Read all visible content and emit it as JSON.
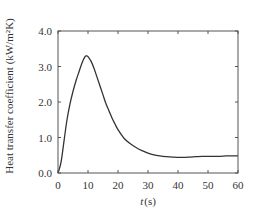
{
  "chart_data": {
    "type": "line",
    "title": "",
    "xlabel": "t (s)",
    "xlabel_var": "t",
    "xlabel_unit": "(s)",
    "ylabel": "Heat transfer coefficient (kW/m²K)",
    "xlim": [
      0,
      60
    ],
    "ylim": [
      0.0,
      4.0
    ],
    "xticks": [
      0,
      10,
      20,
      30,
      40,
      50,
      60
    ],
    "xtick_labels": [
      "0",
      "10",
      "20",
      "30",
      "40",
      "50",
      "60"
    ],
    "yticks": [
      0.0,
      1.0,
      2.0,
      3.0,
      4.0
    ],
    "ytick_labels": [
      "0.0",
      "1.0",
      "2.0",
      "3.0",
      "4.0"
    ],
    "grid": false,
    "legend": null,
    "series": [
      {
        "name": "Heat transfer coefficient",
        "color": "#333333",
        "x": [
          0,
          1,
          2,
          3,
          4,
          5,
          6,
          7,
          8,
          9,
          9.5,
          10,
          11,
          12,
          13,
          14,
          15,
          16,
          17,
          18,
          19,
          20,
          22,
          24,
          26,
          28,
          30,
          32,
          34,
          36,
          38,
          40,
          42,
          44,
          46,
          48,
          50,
          52,
          54,
          56,
          58,
          60
        ],
        "y": [
          0.0,
          0.3,
          0.9,
          1.5,
          1.95,
          2.3,
          2.6,
          2.85,
          3.1,
          3.28,
          3.3,
          3.28,
          3.15,
          2.95,
          2.7,
          2.45,
          2.2,
          1.95,
          1.75,
          1.55,
          1.38,
          1.22,
          0.98,
          0.83,
          0.72,
          0.63,
          0.56,
          0.51,
          0.48,
          0.46,
          0.45,
          0.44,
          0.44,
          0.45,
          0.46,
          0.47,
          0.47,
          0.47,
          0.47,
          0.48,
          0.48,
          0.48
        ]
      }
    ]
  }
}
